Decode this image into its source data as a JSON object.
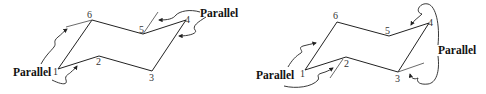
{
  "figure": {
    "stroke_color": "#222222",
    "background": "#ffffff"
  },
  "left_chair": {
    "vertices": [
      {
        "label": "1",
        "x": 58,
        "y": 69
      },
      {
        "label": "2",
        "x": 99,
        "y": 56
      },
      {
        "label": "3",
        "x": 152,
        "y": 71
      },
      {
        "label": "4",
        "x": 186,
        "y": 20
      },
      {
        "label": "5",
        "x": 143,
        "y": 34
      },
      {
        "label": "6",
        "x": 92,
        "y": 20
      }
    ],
    "annotations": [
      {
        "text": "Parallel",
        "position": "lower-left",
        "relates": "bond 1-6 parallel to extension from 6"
      },
      {
        "text": "Parallel",
        "position": "upper-right",
        "relates": "bond 4-5 parallel to bond 3-4 extension at 5"
      }
    ]
  },
  "right_chair": {
    "vertices": [
      {
        "label": "1",
        "x": 305,
        "y": 70
      },
      {
        "label": "2",
        "x": 346,
        "y": 57
      },
      {
        "label": "3",
        "x": 398,
        "y": 72
      },
      {
        "label": "4",
        "x": 429,
        "y": 23
      },
      {
        "label": "5",
        "x": 389,
        "y": 36
      },
      {
        "label": "6",
        "x": 337,
        "y": 22
      }
    ],
    "annotations": [
      {
        "text": "Parallel",
        "position": "lower-left",
        "relates": "bond 1-6 parallel to extension at 2"
      },
      {
        "text": "Parallel",
        "position": "right",
        "relates": "bond 4-5 parallel to extension at 3"
      }
    ]
  },
  "labels": {
    "l1": "1",
    "l2": "2",
    "l3": "3",
    "l4": "4",
    "l5": "5",
    "l6": "6",
    "r1": "1",
    "r2": "2",
    "r3": "3",
    "r4": "4",
    "r5": "5",
    "r6": "6",
    "left_parallel_a": "Parallel",
    "left_parallel_b": "Parallel",
    "right_parallel_a": "Parallel",
    "right_parallel_b": "Parallel"
  }
}
